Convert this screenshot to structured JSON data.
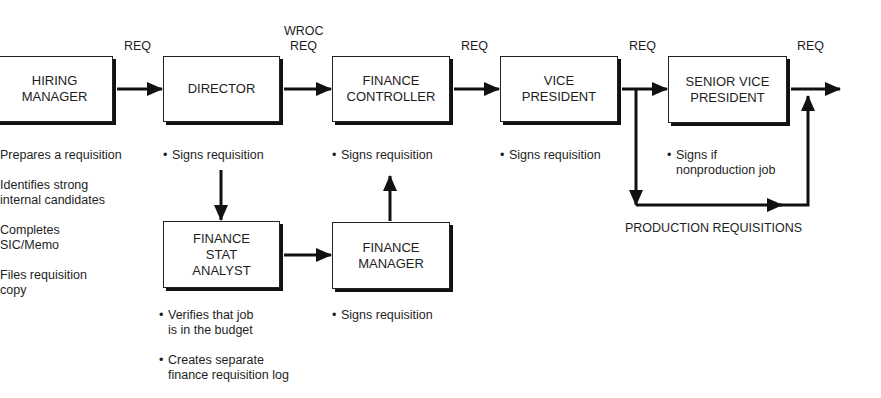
{
  "diagram": {
    "boxes": {
      "hiring_manager": [
        "HIRING",
        "MANAGER"
      ],
      "director": [
        "DIRECTOR"
      ],
      "finance_controller": [
        "FINANCE",
        "CONTROLLER"
      ],
      "vice_president": [
        "VICE",
        "PRESIDENT"
      ],
      "senior_vice_president": [
        "SENIOR VICE",
        "PRESIDENT"
      ],
      "finance_stat_analyst": [
        "FINANCE",
        "STAT",
        "ANALYST"
      ],
      "finance_manager": [
        "FINANCE",
        "MANAGER"
      ]
    },
    "edge_labels": {
      "hm_to_director": "REQ",
      "director_to_fc_line1": "WROC",
      "director_to_fc_line2": "REQ",
      "fc_to_vp": "REQ",
      "vp_to_svp": "REQ",
      "svp_out": "REQ",
      "production": "PRODUCTION REQUISITIONS"
    },
    "notes": {
      "hiring_manager": [
        "Prepares a requisition",
        "Identifies strong\ninternal candidates",
        "Completes\nSIC/Memo",
        "Files requisition\ncopy"
      ],
      "director": [
        "Signs requisition"
      ],
      "finance_controller": [
        "Signs requisition"
      ],
      "vice_president": [
        "Signs requisition"
      ],
      "senior_vice_president": [
        "Signs if\nnonproduction job"
      ],
      "finance_stat_analyst": [
        "Verifies that job\nis in the budget",
        "Creates separate\nfinance requisition log"
      ],
      "finance_manager": [
        "Signs requisition"
      ]
    },
    "bullet": "•"
  }
}
